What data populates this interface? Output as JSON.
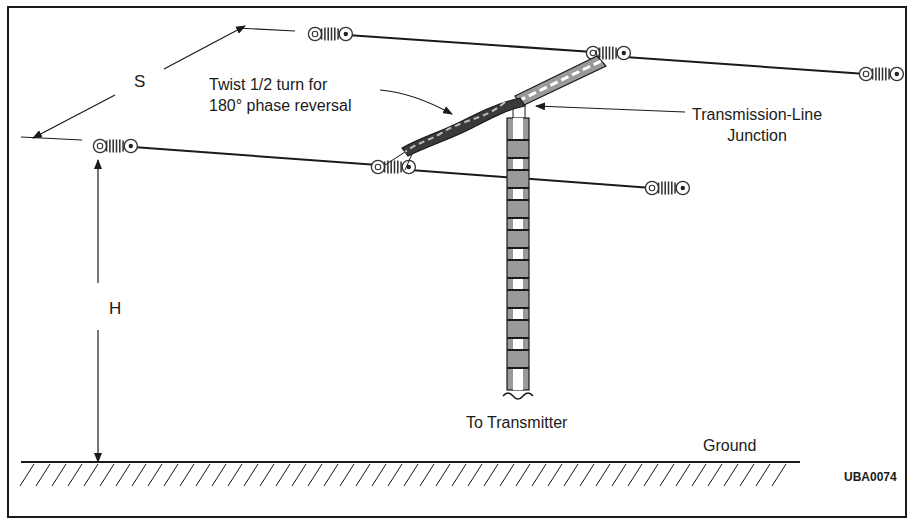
{
  "figure": {
    "id_label": "UBA0074",
    "labels": {
      "spacing": "S",
      "height": "H",
      "twist_line1": "Twist 1/2 turn for",
      "twist_line2": "180° phase reversal",
      "junction_line1": "Transmission-Line",
      "junction_line2": "Junction",
      "to_transmitter": "To Transmitter",
      "ground": "Ground"
    },
    "components": [
      {
        "name": "rear-dipole",
        "description": "upper/rear antenna element with insulators"
      },
      {
        "name": "front-dipole",
        "description": "lower/front antenna element with insulators"
      },
      {
        "name": "phasing-line",
        "description": "ladder line between dipoles, twisted half turn"
      },
      {
        "name": "feed-line",
        "description": "vertical ladder line to transmitter"
      },
      {
        "name": "ground-plane",
        "description": "hatched ground line"
      }
    ],
    "colors": {
      "ink": "#1a1a1a",
      "ladder_fill": "#9a9a9a",
      "background": "#ffffff"
    }
  }
}
